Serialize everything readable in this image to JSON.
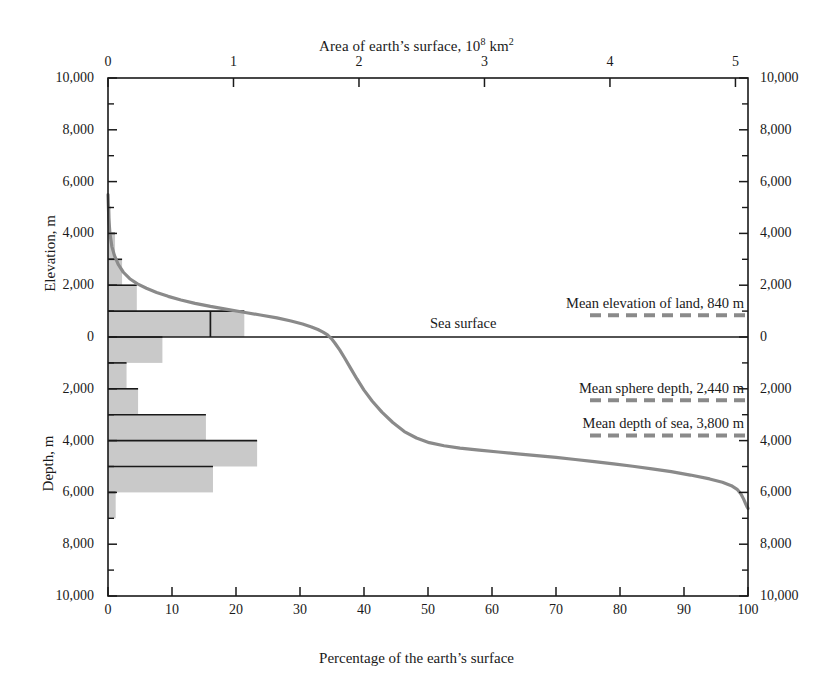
{
  "figure": {
    "top_axis_title_main": "Area of earth’s surface, 10",
    "top_axis_title_sup": "8",
    "top_axis_title_tail": " km",
    "top_axis_title_sup2": "2",
    "bottom_axis_title": "Percentage of the earth’s surface",
    "left_axis_name_upper": "Elevation, m",
    "left_axis_name_lower": "Depth, m",
    "sea_surface_label": "Sea  surface"
  },
  "annotations": [
    {
      "name": "mean-elevation-of-land",
      "label": "Mean elevation of land, 840 m",
      "value_m": 840,
      "signed_m": 840
    },
    {
      "name": "mean-sphere-depth",
      "label": "Mean sphere depth, 2,440 m",
      "value_m": 2440,
      "signed_m": -2440
    },
    {
      "name": "mean-depth-of-sea",
      "label": "Mean depth of sea, 3,800 m",
      "value_m": 3800,
      "signed_m": -3800
    }
  ],
  "chart_data": {
    "type": "line",
    "xlabel": "Percentage of the earth’s surface",
    "ylabel": "Elevation / Depth, m",
    "x2label": "Area of earth’s surface, 10^8 km^2",
    "grid": false,
    "legend": "none",
    "xlim": [
      0,
      100
    ],
    "ylim": [
      -10000,
      10000
    ],
    "x2lim": [
      0,
      5.1
    ],
    "xticks": [
      0,
      10,
      20,
      30,
      40,
      50,
      60,
      70,
      80,
      90,
      100
    ],
    "xticklabels": [
      "0",
      "10",
      "20",
      "30",
      "40",
      "50",
      "60",
      "70",
      "80",
      "90",
      "100"
    ],
    "x2ticks": [
      0,
      1,
      2,
      3,
      4,
      5
    ],
    "x2ticklabels": [
      "0",
      "1",
      "2",
      "3",
      "4",
      "5"
    ],
    "yticks": [
      10000,
      8000,
      6000,
      4000,
      2000,
      0,
      -2000,
      -4000,
      -6000,
      -8000,
      -10000
    ],
    "yticklabels_left": [
      "10,000",
      "8,000",
      "6,000",
      "4,000",
      "2,000",
      "0",
      "2,000",
      "4,000",
      "6,000",
      "8,000",
      "10,000"
    ],
    "yticklabels_right": [
      "10,000",
      "8,000",
      "6,000",
      "4,000",
      "2,000",
      "0",
      "2,000",
      "4,000",
      "6,000",
      "8,000",
      "10,000"
    ],
    "yminorticks": [
      9000,
      7000,
      5000,
      3000,
      1000,
      -1000,
      -3000,
      -5000,
      -7000,
      -9000
    ],
    "series": [
      {
        "name": "hypsographic curve",
        "color": "#8a8a8a",
        "linewidth": 3.2,
        "points": [
          [
            0.0,
            5500
          ],
          [
            0.12,
            4600
          ],
          [
            0.3,
            4000
          ],
          [
            0.6,
            3500
          ],
          [
            1.0,
            3150
          ],
          [
            1.6,
            2800
          ],
          [
            2.4,
            2500
          ],
          [
            3.4,
            2250
          ],
          [
            4.6,
            2050
          ],
          [
            6.0,
            1880
          ],
          [
            7.6,
            1720
          ],
          [
            9.4,
            1570
          ],
          [
            11.4,
            1430
          ],
          [
            13.6,
            1300
          ],
          [
            16.0,
            1180
          ],
          [
            18.6,
            1065
          ],
          [
            21.2,
            955
          ],
          [
            23.8,
            850
          ],
          [
            26.4,
            740
          ],
          [
            28.6,
            620
          ],
          [
            30.4,
            500
          ],
          [
            31.8,
            390
          ],
          [
            32.8,
            290
          ],
          [
            33.6,
            190
          ],
          [
            34.3,
            80
          ],
          [
            34.9,
            -60
          ],
          [
            35.5,
            -250
          ],
          [
            36.2,
            -500
          ],
          [
            37.0,
            -820
          ],
          [
            37.9,
            -1200
          ],
          [
            38.9,
            -1620
          ],
          [
            40.0,
            -2050
          ],
          [
            41.3,
            -2480
          ],
          [
            42.8,
            -2900
          ],
          [
            44.5,
            -3300
          ],
          [
            46.3,
            -3650
          ],
          [
            48.2,
            -3900
          ],
          [
            50.2,
            -4080
          ],
          [
            52.5,
            -4200
          ],
          [
            55.0,
            -4290
          ],
          [
            58.0,
            -4370
          ],
          [
            61.0,
            -4440
          ],
          [
            64.0,
            -4510
          ],
          [
            67.0,
            -4580
          ],
          [
            70.0,
            -4650
          ],
          [
            73.0,
            -4730
          ],
          [
            76.0,
            -4810
          ],
          [
            79.0,
            -4900
          ],
          [
            82.0,
            -4990
          ],
          [
            85.0,
            -5090
          ],
          [
            88.0,
            -5200
          ],
          [
            91.0,
            -5330
          ],
          [
            94.0,
            -5480
          ],
          [
            96.0,
            -5610
          ],
          [
            97.4,
            -5740
          ],
          [
            98.3,
            -5880
          ],
          [
            98.9,
            -6060
          ],
          [
            99.3,
            -6250
          ],
          [
            99.6,
            -6420
          ],
          [
            99.85,
            -6560
          ],
          [
            100.0,
            -6620
          ]
        ]
      }
    ],
    "histogram": {
      "name": "area-frequency histogram",
      "color": "#c9c9c9",
      "edge_color": "#1a1a1a",
      "bin_height_m": 1000,
      "unit": "percent of earth's surface",
      "bins": [
        {
          "top_m": 6000,
          "bottom_m": 5000,
          "percent": 0.05
        },
        {
          "top_m": 5000,
          "bottom_m": 4000,
          "percent": 0.4
        },
        {
          "top_m": 4000,
          "bottom_m": 3000,
          "percent": 1.1
        },
        {
          "top_m": 3000,
          "bottom_m": 2000,
          "percent": 2.2
        },
        {
          "top_m": 2000,
          "bottom_m": 1000,
          "percent": 4.5
        },
        {
          "top_m": 1000,
          "bottom_m": 0,
          "percent": 21.3,
          "marker_percent": 16.0
        },
        {
          "top_m": 0,
          "bottom_m": -1000,
          "percent": 8.5
        },
        {
          "top_m": -1000,
          "bottom_m": -2000,
          "percent": 2.9
        },
        {
          "top_m": -2000,
          "bottom_m": -3000,
          "percent": 4.7
        },
        {
          "top_m": -3000,
          "bottom_m": -4000,
          "percent": 15.3
        },
        {
          "top_m": -4000,
          "bottom_m": -5000,
          "percent": 23.3
        },
        {
          "top_m": -5000,
          "bottom_m": -6000,
          "percent": 16.4
        },
        {
          "top_m": -6000,
          "bottom_m": -7000,
          "percent": 1.2
        }
      ]
    }
  }
}
